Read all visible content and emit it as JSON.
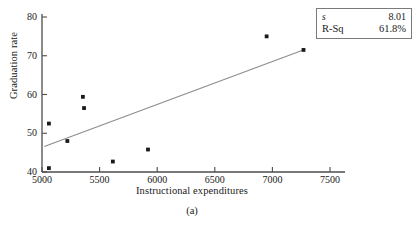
{
  "figure": {
    "caption": "(a)",
    "background": "#ffffff",
    "line_color": "#8c8c8c",
    "point_color": "#1a1a1a",
    "axis_color": "#4d4d4d"
  },
  "legend": {
    "rows": [
      {
        "key": "s",
        "value": "8.01"
      },
      {
        "key": "R-Sq",
        "value": "61.8%"
      }
    ]
  },
  "chart_data": {
    "type": "scatter",
    "title": "",
    "subtitle": "",
    "xlabel": "Instructional expenditures",
    "ylabel": "Graduation rate",
    "xlim": [
      5000,
      7500
    ],
    "ylim": [
      40,
      80
    ],
    "xticks": [
      5000,
      5500,
      6000,
      6500,
      7000,
      7500
    ],
    "yticks": [
      40,
      50,
      60,
      70,
      80
    ],
    "xticklabels": [
      "5000",
      "5500",
      "6000",
      "6500",
      "7000",
      "7500"
    ],
    "yticklabels": [
      "40",
      "50",
      "60",
      "70",
      "80"
    ],
    "grid": false,
    "legend_position": "top-right",
    "series": [
      {
        "name": "observations",
        "marker": "square",
        "x": [
          5060,
          5060,
          5220,
          5355,
          5365,
          5615,
          5920,
          6950,
          7270
        ],
        "y": [
          52.5,
          41.0,
          48.0,
          59.4,
          56.5,
          42.7,
          45.8,
          75.0,
          71.5
        ]
      }
    ],
    "fit_line": {
      "name": "regression-line",
      "x": [
        5020,
        7280
      ],
      "y": [
        46.6,
        71.6
      ]
    },
    "annotations": [
      {
        "text": "s = 8.01"
      },
      {
        "text": "R-Sq = 61.8%"
      }
    ]
  }
}
